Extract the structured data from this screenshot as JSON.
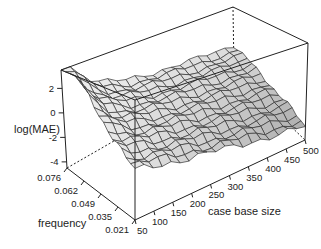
{
  "chart_data": {
    "type": "surface3d",
    "title": "",
    "zlabel": "log(MAE)",
    "xlabel": "case base size",
    "ylabel": "frequency",
    "x_ticks": [
      50,
      100,
      150,
      200,
      250,
      300,
      350,
      400,
      450,
      500
    ],
    "y_ticks": [
      "0.021",
      "0.035",
      "0.049",
      "0.062",
      "0.076"
    ],
    "z_ticks": [
      -4,
      -2,
      0,
      2
    ],
    "zlim": [
      -4.5,
      3.5
    ],
    "grid_size": [
      19,
      16
    ],
    "corner_values": {
      "size50_freq0.076": 2.9,
      "size50_freq0.021": -1.2,
      "size500_freq0.076": -0.8,
      "size500_freq0.021": -3.4
    },
    "surface_color": "#d9d9d9",
    "mesh_color": "#333333"
  }
}
